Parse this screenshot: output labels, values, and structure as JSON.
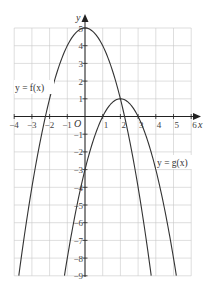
{
  "chart_data": {
    "type": "line",
    "title": "",
    "xlabel": "x",
    "ylabel": "y",
    "origin_label": "O",
    "xlim": [
      -4,
      6
    ],
    "ylim": [
      -9,
      5
    ],
    "grid": true,
    "x_ticks": [
      -4,
      -3,
      -2,
      -1,
      1,
      2,
      3,
      4,
      5,
      6
    ],
    "y_ticks": [
      -9,
      -8,
      -7,
      -6,
      -5,
      -4,
      -3,
      -2,
      -1,
      1,
      2,
      3,
      4,
      5
    ],
    "series": [
      {
        "name": "y = f(x)",
        "expression": "5 - x^2",
        "x": [
          -3.74,
          -3,
          -2,
          -1,
          0,
          1,
          2,
          3,
          3.74
        ],
        "values": [
          -9,
          -4,
          1,
          4,
          5,
          4,
          1,
          -4,
          -9
        ]
      },
      {
        "name": "y = g(x)",
        "expression": "1 - (x-2)^2",
        "x": [
          -1.16,
          0,
          1,
          2,
          3,
          4,
          5.16
        ],
        "values": [
          -9,
          -3,
          0,
          1,
          0,
          -3,
          -9
        ]
      }
    ]
  },
  "labels": {
    "f": "y = f(x)",
    "g": "y = g(x)",
    "x_axis": "x",
    "y_axis": "y",
    "origin": "O"
  },
  "x_tick_labels": [
    "−4",
    "−3",
    "−2",
    "−1",
    "1",
    "2",
    "3",
    "4",
    "5",
    "6"
  ],
  "y_tick_labels": [
    "5",
    "4",
    "3",
    "2",
    "1",
    "−1",
    "−2",
    "−3",
    "−4",
    "−5",
    "−6",
    "−7",
    "−8",
    "−9"
  ]
}
